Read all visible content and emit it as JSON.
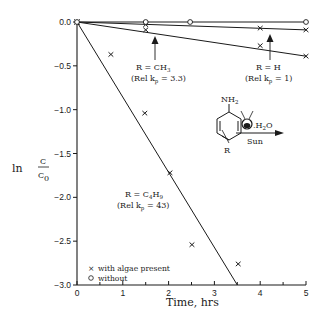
{
  "chart_data": {
    "type": "scatter",
    "title": "",
    "xlabel": "Time, hrs",
    "ylabel": "ln C/C0",
    "ylabel_parts": {
      "ln": "ln",
      "num": "C",
      "den": "C",
      "den_sub": "0"
    },
    "xlim": [
      0,
      5
    ],
    "ylim": [
      -3.0,
      0.0
    ],
    "x_ticks": [
      0,
      1,
      2,
      3,
      4,
      5
    ],
    "x_tick_labels": [
      "0",
      "1",
      "2",
      "3",
      "4",
      "5"
    ],
    "y_ticks": [
      0.0,
      -0.5,
      -1.0,
      -1.5,
      -2.0,
      -2.5,
      -3.0
    ],
    "y_tick_labels": [
      "0.0",
      "-0.5",
      "-1.0",
      "-1.5",
      "-2.0",
      "-2.5",
      "-3.0"
    ],
    "grid": false,
    "legend_position": "lower-left",
    "legend": [
      {
        "marker": "×",
        "label": "with algae present"
      },
      {
        "marker": "○",
        "label": "without"
      }
    ],
    "series": [
      {
        "name": "R = H, with algae",
        "marker": "x",
        "points": [
          [
            0,
            0.0
          ],
          [
            1.5,
            -0.03
          ],
          [
            4.0,
            -0.07
          ],
          [
            5.0,
            -0.09
          ]
        ],
        "fit_line": [
          [
            0,
            0.0
          ],
          [
            5.0,
            -0.09
          ]
        ]
      },
      {
        "name": "R = CH3, with algae",
        "marker": "x",
        "points": [
          [
            0,
            0.0
          ],
          [
            1.5,
            -0.09
          ],
          [
            4.0,
            -0.27
          ],
          [
            5.0,
            -0.39
          ]
        ],
        "fit_line": [
          [
            0,
            0.0
          ],
          [
            5.0,
            -0.39
          ]
        ]
      },
      {
        "name": "R = C4H9, with algae",
        "marker": "x",
        "points": [
          [
            0,
            0.0
          ],
          [
            0.74,
            -0.37
          ],
          [
            1.48,
            -1.04
          ],
          [
            2.03,
            -1.72
          ],
          [
            2.51,
            -2.54
          ],
          [
            3.52,
            -2.76
          ]
        ],
        "fit_line": [
          [
            0,
            0.0
          ],
          [
            3.5,
            -3.0
          ]
        ]
      },
      {
        "name": "without algae",
        "marker": "o",
        "points": [
          [
            0,
            0.0
          ],
          [
            1.5,
            0.0
          ],
          [
            2.47,
            0.0
          ],
          [
            5.0,
            0.0
          ]
        ],
        "fit_line": [
          [
            0,
            0.0
          ],
          [
            5.0,
            0.0
          ]
        ]
      }
    ],
    "annotations": [
      {
        "id": "ch3",
        "line1": "R = CH",
        "line1_sub": "3",
        "line2_pre": "(Rel k",
        "line2_sub": "p",
        "line2_post": " = 3.3)",
        "arrow_to": [
          1.7,
          -0.06
        ]
      },
      {
        "id": "h",
        "line1": "R = H",
        "line1_sub": "",
        "line2_pre": "(Rel k",
        "line2_sub": "p",
        "line2_post": " = 1)",
        "arrow_to": [
          4.2,
          -0.08
        ]
      },
      {
        "id": "c4h9",
        "line1": "R = C",
        "line1_sub": "4",
        "line1_post": "H",
        "line1_sub2": "9",
        "line2_pre": "(Rel k",
        "line2_sub": "p",
        "line2_post": " = 43)"
      }
    ],
    "reaction_scheme": {
      "reactant_group": "NH",
      "reactant_group_sub": "2",
      "substituent": "R",
      "reagent": ".H",
      "reagent_sub": "2",
      "reagent_post": "O",
      "condition": "Sun"
    }
  }
}
